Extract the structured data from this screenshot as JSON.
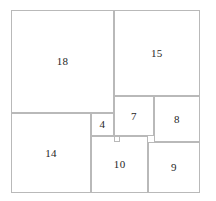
{
  "figure": {
    "type": "squared-square-dissection",
    "title": "",
    "outer": {
      "x": 0,
      "y": 0,
      "w": 33,
      "h": 32,
      "label": ""
    },
    "unit_px": 5.72,
    "origin_px": {
      "x": 11,
      "y": 10
    },
    "stroke_color": "#b9b9b9",
    "label_color": "#262626",
    "background": "#ffffff",
    "squares": [
      {
        "id": "sq-18",
        "label": "18",
        "x": 0,
        "y": 0,
        "size": 18,
        "show_label": true
      },
      {
        "id": "sq-15",
        "label": "15",
        "x": 18,
        "y": 0,
        "size": 15,
        "show_label": true
      },
      {
        "id": "sq-7",
        "label": "7",
        "x": 18,
        "y": 15,
        "size": 7,
        "show_label": true
      },
      {
        "id": "sq-8",
        "label": "8",
        "x": 25,
        "y": 15,
        "size": 8,
        "show_label": true
      },
      {
        "id": "sq-14",
        "label": "14",
        "x": 0,
        "y": 18,
        "size": 14,
        "show_label": true
      },
      {
        "id": "sq-4",
        "label": "4",
        "x": 14,
        "y": 18,
        "size": 4,
        "show_label": true
      },
      {
        "id": "sq-1",
        "label": "1",
        "x": 18,
        "y": 22,
        "size": 1,
        "show_label": false
      },
      {
        "id": "sq-10",
        "label": "10",
        "x": 14,
        "y": 22,
        "size": 10,
        "show_label": true
      },
      {
        "id": "sq-9",
        "label": "9",
        "x": 24,
        "y": 23,
        "size": 9,
        "show_label": true
      }
    ]
  }
}
